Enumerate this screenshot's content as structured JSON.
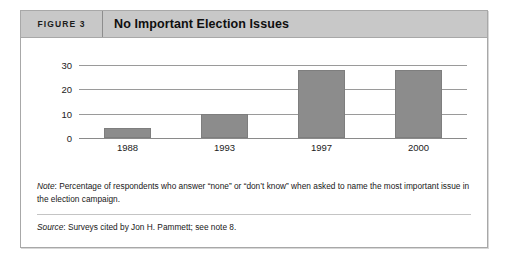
{
  "figure": {
    "number_label": "FIGURE 3",
    "title": "No Important Election Issues"
  },
  "footnotes": {
    "note_label": "Note",
    "note_text": ": Percentage of respondents who answer “none” or “don’t know” when asked to name the most important issue in the election campaign.",
    "source_label": "Source",
    "source_text": ": Surveys cited by Jon H. Pammett; see note 8."
  },
  "colors": {
    "header_background": "#c8c8c8",
    "bar_fill": "#8c8c8c",
    "bar_stroke": "#7e7e7e",
    "gridline": "#9a9a9a",
    "frame_border": "#a8a8a8"
  },
  "chart_data": {
    "type": "bar",
    "title": "No Important Election Issues",
    "xlabel": "",
    "ylabel": "",
    "categories": [
      "1988",
      "1993",
      "1997",
      "2000"
    ],
    "values": [
      4,
      10,
      28,
      28
    ],
    "yticks": [
      0,
      10,
      20,
      30
    ],
    "ylim": [
      0,
      32
    ],
    "grid": true,
    "legend": false,
    "series": [
      {
        "name": "Percentage of respondents with no important issue",
        "values": [
          4,
          10,
          28,
          28
        ]
      }
    ]
  }
}
